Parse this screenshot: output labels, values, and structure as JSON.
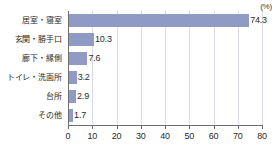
{
  "chart_data": {
    "type": "bar",
    "orientation": "horizontal",
    "title": "",
    "subtitle": "",
    "xlabel": "",
    "ylabel": "",
    "unit_label": "(%)",
    "categories": [
      "居室・寝室",
      "玄関・勝手口",
      "廊下・縁側",
      "トイレ・洗面所",
      "台所",
      "その他"
    ],
    "values": [
      74.3,
      10.3,
      7.6,
      3.2,
      2.9,
      1.7
    ],
    "value_labels": [
      "74.3",
      "10.3",
      "7.6",
      "3.2",
      "2.9",
      "1.7"
    ],
    "xlim": [
      0,
      80
    ],
    "xticks": [
      0,
      10,
      20,
      30,
      40,
      50,
      60,
      70,
      80
    ],
    "xtick_labels": [
      "0",
      "10",
      "20",
      "30",
      "40",
      "50",
      "60",
      "70",
      "80"
    ],
    "grid": true,
    "grid_axis": "x",
    "legend": false,
    "bar_color": "#8f9bc4",
    "axis_color": "#6e6e6e",
    "grid_color": "#d8dce6",
    "text_color": "#2b2b2b",
    "background": "#ffffff"
  }
}
